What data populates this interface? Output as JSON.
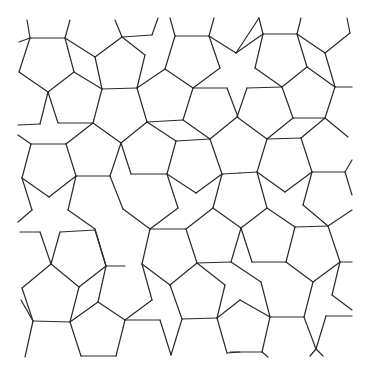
{
  "figure": {
    "type": "pentagonal-tiling-line-art",
    "width": 370,
    "height": 374,
    "stroke_color": "#2a2a2a",
    "background": "#ffffff",
    "segments": [
      [
        27,
        20,
        30,
        38
      ],
      [
        70,
        20,
        65,
        38
      ],
      [
        19,
        42,
        30,
        38
      ],
      [
        30,
        38,
        65,
        38
      ],
      [
        65,
        38,
        74,
        72
      ],
      [
        74,
        72,
        48,
        92
      ],
      [
        48,
        92,
        19,
        72
      ],
      [
        19,
        72,
        30,
        38
      ],
      [
        65,
        38,
        95,
        57
      ],
      [
        95,
        57,
        102,
        89
      ],
      [
        74,
        72,
        102,
        89
      ],
      [
        115,
        20,
        122,
        37
      ],
      [
        122,
        37,
        152,
        35
      ],
      [
        152,
        35,
        158,
        18
      ],
      [
        122,
        37,
        95,
        57
      ],
      [
        48,
        92,
        58,
        123
      ],
      [
        48,
        92,
        40,
        124
      ],
      [
        40,
        124,
        18,
        125
      ],
      [
        58,
        123,
        93,
        123
      ],
      [
        93,
        123,
        102,
        89
      ],
      [
        102,
        89,
        137,
        88
      ],
      [
        122,
        37,
        145,
        55
      ],
      [
        145,
        55,
        137,
        88
      ],
      [
        170,
        18,
        175,
        36
      ],
      [
        175,
        36,
        209,
        36
      ],
      [
        209,
        36,
        214,
        18
      ],
      [
        175,
        36,
        165,
        69
      ],
      [
        165,
        69,
        137,
        88
      ],
      [
        209,
        36,
        220,
        68
      ],
      [
        220,
        68,
        193,
        88
      ],
      [
        165,
        69,
        193,
        88
      ],
      [
        193,
        88,
        227,
        88
      ],
      [
        209,
        36,
        236,
        53
      ],
      [
        236,
        53,
        259,
        18
      ],
      [
        259,
        18,
        263,
        34
      ],
      [
        263,
        34,
        297,
        34
      ],
      [
        297,
        34,
        301,
        18
      ],
      [
        263,
        34,
        236,
        53
      ],
      [
        263,
        34,
        255,
        68
      ],
      [
        255,
        68,
        282,
        87
      ],
      [
        297,
        34,
        307,
        67
      ],
      [
        307,
        67,
        282,
        87
      ],
      [
        297,
        34,
        325,
        53
      ],
      [
        325,
        53,
        335,
        87
      ],
      [
        307,
        67,
        335,
        87
      ],
      [
        325,
        53,
        350,
        33
      ],
      [
        350,
        33,
        347,
        18
      ],
      [
        335,
        87,
        352,
        87
      ],
      [
        282,
        87,
        293,
        118
      ],
      [
        247,
        88,
        282,
        87
      ],
      [
        227,
        88,
        238,
        117
      ],
      [
        247,
        88,
        237,
        117
      ],
      [
        335,
        87,
        325,
        118
      ],
      [
        293,
        118,
        325,
        118
      ],
      [
        137,
        88,
        147,
        122
      ],
      [
        193,
        88,
        183,
        120
      ],
      [
        147,
        122,
        183,
        120
      ],
      [
        18,
        135,
        31,
        144
      ],
      [
        31,
        144,
        66,
        144
      ],
      [
        66,
        144,
        93,
        123
      ],
      [
        66,
        144,
        76,
        176
      ],
      [
        31,
        144,
        22,
        178
      ],
      [
        22,
        178,
        49,
        197
      ],
      [
        49,
        197,
        76,
        176
      ],
      [
        76,
        176,
        110,
        176
      ],
      [
        76,
        176,
        68,
        210
      ],
      [
        68,
        210,
        95,
        229
      ],
      [
        22,
        178,
        32,
        210
      ],
      [
        32,
        210,
        18,
        222
      ],
      [
        147,
        122,
        121,
        143
      ],
      [
        121,
        143,
        93,
        123
      ],
      [
        147,
        122,
        176,
        141
      ],
      [
        183,
        120,
        210,
        139
      ],
      [
        176,
        141,
        210,
        139
      ],
      [
        121,
        143,
        110,
        176
      ],
      [
        121,
        143,
        131,
        174
      ],
      [
        176,
        141,
        167,
        174
      ],
      [
        131,
        174,
        167,
        174
      ],
      [
        210,
        139,
        222,
        174
      ],
      [
        222,
        174,
        240,
        173
      ],
      [
        167,
        174,
        196,
        193
      ],
      [
        196,
        193,
        222,
        174
      ],
      [
        110,
        176,
        123,
        209
      ],
      [
        167,
        174,
        178,
        208
      ],
      [
        178,
        208,
        150,
        229
      ],
      [
        123,
        209,
        150,
        229
      ],
      [
        222,
        174,
        213,
        208
      ],
      [
        213,
        208,
        241,
        228
      ],
      [
        150,
        229,
        186,
        229
      ],
      [
        186,
        229,
        213,
        208
      ],
      [
        237,
        117,
        210,
        139
      ],
      [
        237,
        117,
        267,
        139
      ],
      [
        267,
        139,
        301,
        138
      ],
      [
        293,
        118,
        267,
        139
      ],
      [
        325,
        118,
        348,
        137
      ],
      [
        301,
        138,
        325,
        118
      ],
      [
        301,
        138,
        312,
        172
      ],
      [
        267,
        139,
        257,
        172
      ],
      [
        257,
        172,
        285,
        192
      ],
      [
        285,
        192,
        312,
        172
      ],
      [
        312,
        172,
        345,
        172
      ],
      [
        345,
        172,
        352,
        160
      ],
      [
        345,
        172,
        352,
        195
      ],
      [
        240,
        173,
        257,
        172
      ],
      [
        257,
        172,
        267,
        208
      ],
      [
        267,
        208,
        241,
        228
      ],
      [
        312,
        172,
        303,
        205
      ],
      [
        303,
        205,
        328,
        226
      ],
      [
        267,
        208,
        295,
        227
      ],
      [
        295,
        227,
        328,
        226
      ],
      [
        328,
        226,
        352,
        210
      ],
      [
        20,
        232,
        40,
        232
      ],
      [
        40,
        232,
        51,
        264
      ],
      [
        60,
        232,
        95,
        230
      ],
      [
        51,
        264,
        60,
        232
      ],
      [
        95,
        230,
        106,
        266
      ],
      [
        106,
        266,
        125,
        266
      ],
      [
        51,
        264,
        22,
        288
      ],
      [
        51,
        264,
        79,
        287
      ],
      [
        22,
        288,
        33,
        321
      ],
      [
        79,
        287,
        70,
        322
      ],
      [
        33,
        321,
        70,
        322
      ],
      [
        106,
        266,
        98,
        302
      ],
      [
        79,
        287,
        106,
        266
      ],
      [
        70,
        322,
        98,
        302
      ],
      [
        98,
        302,
        125,
        320
      ],
      [
        33,
        321,
        25,
        357
      ],
      [
        70,
        322,
        81,
        356
      ],
      [
        81,
        356,
        116,
        356
      ],
      [
        116,
        356,
        125,
        320
      ],
      [
        21,
        300,
        33,
        321
      ],
      [
        95,
        229,
        106,
        266
      ],
      [
        150,
        229,
        142,
        264
      ],
      [
        186,
        229,
        197,
        263
      ],
      [
        142,
        264,
        170,
        285
      ],
      [
        197,
        263,
        170,
        285
      ],
      [
        197,
        263,
        231,
        262
      ],
      [
        197,
        263,
        225,
        285
      ],
      [
        225,
        285,
        217,
        318
      ],
      [
        170,
        285,
        182,
        319
      ],
      [
        182,
        319,
        217,
        318
      ],
      [
        142,
        264,
        152,
        300
      ],
      [
        152,
        300,
        125,
        320
      ],
      [
        125,
        320,
        160,
        320
      ],
      [
        160,
        320,
        171,
        355
      ],
      [
        182,
        319,
        171,
        355
      ],
      [
        217,
        318,
        227,
        353
      ],
      [
        227,
        353,
        240,
        352
      ],
      [
        217,
        318,
        240,
        300
      ],
      [
        241,
        228,
        252,
        262
      ],
      [
        252,
        262,
        286,
        262
      ],
      [
        295,
        227,
        286,
        262
      ],
      [
        328,
        226,
        340,
        262
      ],
      [
        286,
        262,
        313,
        282
      ],
      [
        340,
        262,
        313,
        282
      ],
      [
        340,
        262,
        352,
        262
      ],
      [
        340,
        262,
        332,
        295
      ],
      [
        332,
        295,
        352,
        310
      ],
      [
        231,
        262,
        241,
        228
      ],
      [
        231,
        262,
        261,
        282
      ],
      [
        261,
        282,
        270,
        317
      ],
      [
        313,
        282,
        304,
        317
      ],
      [
        270,
        317,
        304,
        317
      ],
      [
        270,
        317,
        262,
        352
      ],
      [
        304,
        317,
        316,
        349
      ],
      [
        316,
        349,
        326,
        316
      ],
      [
        326,
        316,
        352,
        316
      ],
      [
        240,
        300,
        270,
        317
      ],
      [
        262,
        352,
        230,
        352
      ],
      [
        262,
        352,
        268,
        357
      ],
      [
        316,
        349,
        310,
        356
      ],
      [
        316,
        349,
        323,
        356
      ]
    ]
  }
}
